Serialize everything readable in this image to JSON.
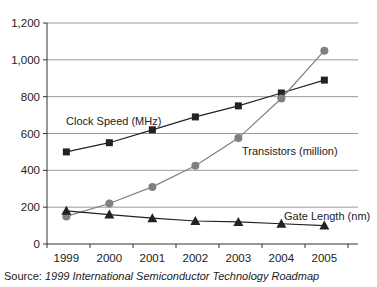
{
  "chart_data": {
    "type": "line",
    "title": "",
    "xlabel": "",
    "ylabel": "",
    "categories": [
      "1999",
      "2000",
      "2001",
      "2002",
      "2003",
      "2004",
      "2005"
    ],
    "ylim": [
      0,
      1200
    ],
    "yticks": [
      "0",
      "200",
      "400",
      "600",
      "800",
      "1,000",
      "1,200"
    ],
    "grid": true,
    "legend": "inline labels",
    "series": [
      {
        "name": "Clock Speed (MHz)",
        "marker": "square",
        "color": "#222222",
        "values": [
          500,
          550,
          620,
          690,
          750,
          820,
          890
        ]
      },
      {
        "name": "Transistors (million)",
        "marker": "circle",
        "color": "#808080",
        "values": [
          150,
          220,
          310,
          425,
          575,
          790,
          1050
        ]
      },
      {
        "name": "Gate Length (nm)",
        "marker": "triangle",
        "color": "#222222",
        "values": [
          180,
          160,
          140,
          125,
          120,
          110,
          100
        ]
      }
    ]
  },
  "labels": {
    "clock": "Clock Speed (MHz)",
    "transistors": "Transistors (million)",
    "gate": "Gate Length (nm)"
  },
  "source": {
    "prefix": "Source: ",
    "title": "1999 International Semiconductor Technology Roadmap"
  }
}
